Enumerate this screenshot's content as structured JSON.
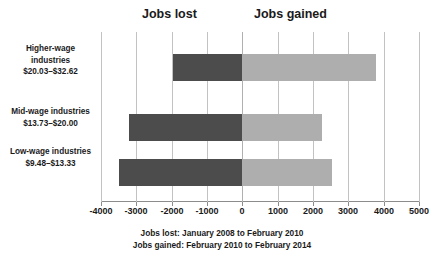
{
  "chart_data": {
    "type": "bar",
    "orientation": "horizontal",
    "title": "",
    "subtitle": "",
    "xlabel": "",
    "ylabel": "",
    "xlim": [
      -4000,
      5000
    ],
    "xticks": [
      -4000,
      -3000,
      -2000,
      -1000,
      0,
      1000,
      2000,
      3000,
      4000,
      5000
    ],
    "xtick_labels": [
      "-4000",
      "-3000",
      "-2000",
      "-1000",
      "0",
      "1000",
      "2000",
      "3000",
      "4000",
      "5000"
    ],
    "grid": true,
    "legend_position": "top",
    "stacked_from_zero": true,
    "categories": [
      "Higher-wage industries $20.03–$32.62",
      "Mid-wage industries $13.73–$20.00",
      "Low-wage industries $9.48–$13.33"
    ],
    "series": [
      {
        "name": "Jobs lost",
        "color": "#4c4c4c",
        "values": [
          -1950,
          -3200,
          -3500
        ]
      },
      {
        "name": "Jobs gained",
        "color": "#aeaeae",
        "values": [
          3800,
          2250,
          2550
        ]
      }
    ],
    "annotations": [
      "Jobs lost: January 2008 to February 2010",
      "Jobs gained: February 2010 to February 2014"
    ]
  },
  "headers": {
    "jobs_lost": "Jobs lost",
    "jobs_gained": "Jobs gained"
  },
  "category_labels": [
    {
      "line1": "Higher-wage",
      "line2": "industries",
      "line3": "$20.03–$32.62"
    },
    {
      "line1": "Mid-wage industries",
      "line2": "$13.73–$20.00",
      "line3": ""
    },
    {
      "line1": "Low-wage industries",
      "line2": "$9.48–$13.33",
      "line3": ""
    }
  ],
  "footnotes": {
    "line1": "Jobs lost: January 2008 to February 2010",
    "line2": "Jobs gained: February 2010 to February 2014"
  },
  "colors": {
    "jobs_lost": "#4c4c4c",
    "jobs_gained": "#aeaeae",
    "gridline": "#c2c2c2",
    "axis": "#8c8c8c",
    "text": "#1a1a1a",
    "background": "#ffffff"
  }
}
